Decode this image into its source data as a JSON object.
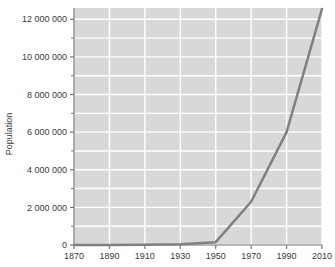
{
  "chart_data": {
    "type": "line",
    "title": "",
    "xlabel": "",
    "ylabel": "Population",
    "x": [
      1870,
      1890,
      1910,
      1930,
      1950,
      1970,
      1990,
      2010
    ],
    "values": [
      1000,
      5000,
      12000,
      40000,
      150000,
      2300000,
      6000000,
      12550000
    ],
    "series": [
      {
        "name": "Population",
        "values": [
          1000,
          5000,
          12000,
          40000,
          150000,
          2300000,
          6000000,
          12550000
        ]
      }
    ],
    "xlim": [
      1870,
      2010
    ],
    "ylim": [
      0,
      12600000
    ],
    "x_tick_labels": [
      "1870",
      "1890",
      "1910",
      "1930",
      "1950",
      "1970",
      "1990",
      "2010"
    ],
    "x_tick_values": [
      1870,
      1890,
      1910,
      1930,
      1950,
      1970,
      1990,
      2010
    ],
    "y_tick_labels": [
      "0",
      "2 000 000",
      "4 000 000",
      "6 000 000",
      "8 000 000",
      "10 000 000",
      "12 000 000"
    ],
    "y_tick_values": [
      0,
      2000000,
      4000000,
      6000000,
      8000000,
      10000000,
      12000000
    ],
    "y_minor_tick_values": [
      1000000,
      3000000,
      5000000,
      7000000,
      9000000,
      11000000
    ],
    "grid": true,
    "grid_color": "#ffffff",
    "plot_background": "#d8d8d8",
    "line_color": "#808080",
    "line_width": 2.5,
    "marker": "none",
    "legend": "none",
    "figure_background": "#ffffff",
    "axis_color": "#777777",
    "tick_label_color": "#3a3a3a"
  }
}
